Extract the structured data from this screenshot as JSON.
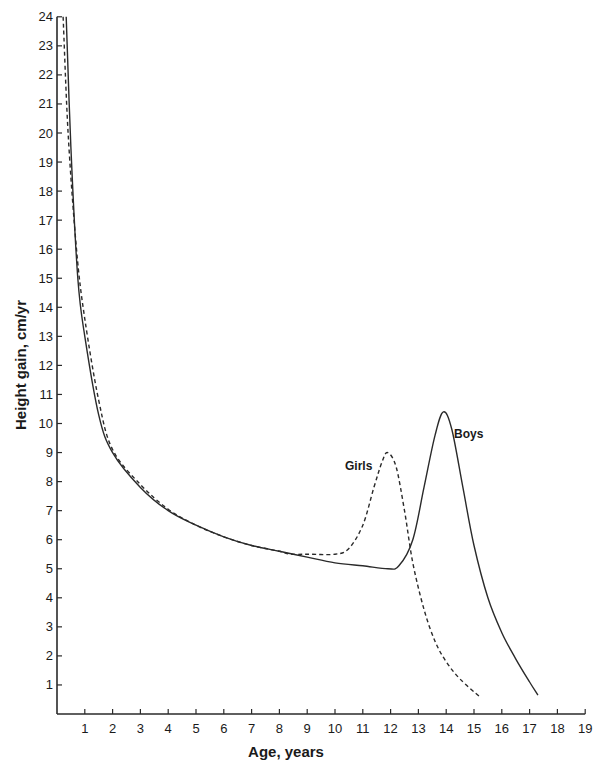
{
  "chart_data": {
    "type": "line",
    "title": "",
    "xlabel": "Age, years",
    "ylabel": "Height gain, cm/yr",
    "xlim": [
      0,
      19
    ],
    "ylim": [
      0,
      24
    ],
    "x_ticks": [
      1,
      2,
      3,
      4,
      5,
      6,
      7,
      8,
      9,
      10,
      11,
      12,
      13,
      14,
      15,
      16,
      17,
      18,
      19
    ],
    "y_ticks": [
      1,
      2,
      3,
      4,
      5,
      6,
      7,
      8,
      9,
      10,
      11,
      12,
      13,
      14,
      15,
      16,
      17,
      18,
      19,
      20,
      21,
      22,
      23,
      24
    ],
    "grid": false,
    "legend": "inline labels near peaks",
    "series": [
      {
        "name": "Boys",
        "style": "solid",
        "points": [
          [
            0.33,
            24
          ],
          [
            0.5,
            19.5
          ],
          [
            0.75,
            15
          ],
          [
            1,
            13
          ],
          [
            1.5,
            10.3
          ],
          [
            2,
            9
          ],
          [
            3,
            7.8
          ],
          [
            4,
            7
          ],
          [
            5,
            6.5
          ],
          [
            6,
            6.1
          ],
          [
            7,
            5.8
          ],
          [
            8,
            5.6
          ],
          [
            9,
            5.4
          ],
          [
            10,
            5.2
          ],
          [
            11,
            5.1
          ],
          [
            11.9,
            5.0
          ],
          [
            12.3,
            5.1
          ],
          [
            12.8,
            6
          ],
          [
            13.2,
            7.8
          ],
          [
            13.6,
            9.6
          ],
          [
            13.9,
            10.4
          ],
          [
            14.2,
            9.8
          ],
          [
            14.6,
            7.8
          ],
          [
            15,
            5.8
          ],
          [
            15.5,
            4
          ],
          [
            16,
            2.8
          ],
          [
            16.5,
            1.9
          ],
          [
            17,
            1.1
          ],
          [
            17.3,
            0.65
          ]
        ]
      },
      {
        "name": "Girls",
        "style": "dashed",
        "points": [
          [
            0.22,
            24
          ],
          [
            0.4,
            20
          ],
          [
            0.7,
            16
          ],
          [
            1,
            13.6
          ],
          [
            1.5,
            10.8
          ],
          [
            2,
            9.1
          ],
          [
            3,
            7.9
          ],
          [
            4,
            7.05
          ],
          [
            5,
            6.5
          ],
          [
            6,
            6.1
          ],
          [
            7,
            5.8
          ],
          [
            8,
            5.6
          ],
          [
            8.4,
            5.5
          ],
          [
            9,
            5.5
          ],
          [
            10,
            5.5
          ],
          [
            10.5,
            5.7
          ],
          [
            11,
            6.5
          ],
          [
            11.4,
            7.8
          ],
          [
            11.7,
            8.7
          ],
          [
            11.9,
            9.0
          ],
          [
            12.2,
            8.5
          ],
          [
            12.5,
            7
          ],
          [
            12.8,
            5.2
          ],
          [
            13.2,
            3.6
          ],
          [
            13.6,
            2.5
          ],
          [
            14,
            1.8
          ],
          [
            14.5,
            1.2
          ],
          [
            15.2,
            0.6
          ]
        ]
      }
    ],
    "annotations": [
      {
        "text": "Boys",
        "x": 14.6,
        "y": 10
      },
      {
        "text": "Girls",
        "x": 10.8,
        "y": 8.6
      }
    ]
  },
  "labels": {
    "xlabel": "Age, years",
    "ylabel": "Height gain, cm/yr",
    "boys": "Boys",
    "girls": "Girls"
  },
  "colors": {
    "ink": "#2a2a2a",
    "background": "#ffffff"
  }
}
